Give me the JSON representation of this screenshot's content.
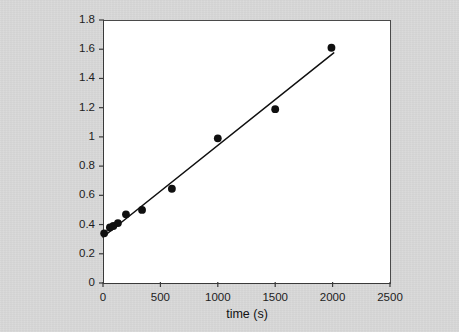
{
  "chart_data": {
    "type": "scatter",
    "title": "",
    "subtitle": "",
    "xlabel": "time (s)",
    "ylabel": "1/[lysine] (l/mg )",
    "xlim": [
      0,
      2500
    ],
    "ylim": [
      0,
      1.8
    ],
    "xticks": [
      0,
      500,
      1000,
      1500,
      2000,
      2500
    ],
    "xtick_labels": [
      "0",
      "500",
      "1000",
      "1500",
      "2000",
      "2500"
    ],
    "yticks": [
      0,
      0.2,
      0.4,
      0.6,
      0.8,
      1,
      1.2,
      1.4,
      1.6,
      1.8
    ],
    "ytick_labels": [
      "0",
      "0.2",
      "0.4",
      "0.6",
      "0.8",
      "1",
      "1.2",
      "1.4",
      "1.6",
      "1.8"
    ],
    "grid": false,
    "legend": false,
    "legend_position": "none",
    "marker_color": "#101010",
    "marker_shape": "circle",
    "line_color": "#101010",
    "series": [
      {
        "name": "1/[lysine]",
        "points": [
          {
            "x": 10,
            "y": 0.34
          },
          {
            "x": 60,
            "y": 0.38
          },
          {
            "x": 90,
            "y": 0.39
          },
          {
            "x": 130,
            "y": 0.41
          },
          {
            "x": 200,
            "y": 0.47
          },
          {
            "x": 340,
            "y": 0.5
          },
          {
            "x": 600,
            "y": 0.645
          },
          {
            "x": 1000,
            "y": 0.99
          },
          {
            "x": 1500,
            "y": 1.19
          },
          {
            "x": 1990,
            "y": 1.61
          }
        ]
      }
    ],
    "fit_line": {
      "name": "linear fit",
      "x_start": 0,
      "y_start": 0.315,
      "x_end": 2010,
      "y_end": 1.575,
      "slope": 0.000627,
      "intercept": 0.315
    }
  }
}
